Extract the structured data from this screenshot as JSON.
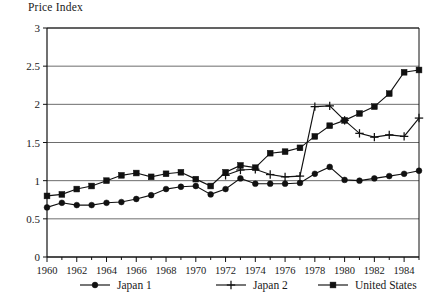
{
  "chart_data": {
    "type": "line",
    "title": "Price Index",
    "ylabel": "Price Index",
    "xlabel": "",
    "ylim": [
      0,
      3
    ],
    "xlim": [
      1960,
      1985
    ],
    "grid": true,
    "legend_position": "bottom",
    "y_ticks": [
      "0",
      "0.5",
      "1",
      "1.5",
      "2",
      "2.5",
      "3"
    ],
    "y_tick_values": [
      0,
      0.5,
      1,
      1.5,
      2,
      2.5,
      3
    ],
    "x_ticks": [
      "1960",
      "1962",
      "1964",
      "1966",
      "1968",
      "1970",
      "1972",
      "1974",
      "1976",
      "1978",
      "1980",
      "1982",
      "1984"
    ],
    "x_tick_values": [
      1960,
      1962,
      1964,
      1966,
      1968,
      1970,
      1972,
      1974,
      1976,
      1978,
      1980,
      1982,
      1984
    ],
    "x": [
      1960,
      1961,
      1962,
      1963,
      1964,
      1965,
      1966,
      1967,
      1968,
      1969,
      1970,
      1971,
      1972,
      1973,
      1974,
      1975,
      1976,
      1977,
      1978,
      1979,
      1980,
      1981,
      1982,
      1983,
      1984,
      1985
    ],
    "series": [
      {
        "name": "Japan 1",
        "marker": "circle",
        "x": [
          1960,
          1961,
          1962,
          1963,
          1964,
          1965,
          1966,
          1967,
          1968,
          1969,
          1970,
          1971,
          1972,
          1973,
          1974,
          1975,
          1976,
          1977,
          1978,
          1979,
          1980,
          1981,
          1982,
          1983,
          1984,
          1985
        ],
        "values": [
          0.65,
          0.71,
          0.68,
          0.68,
          0.71,
          0.72,
          0.76,
          0.81,
          0.89,
          0.92,
          0.93,
          0.82,
          0.89,
          1.03,
          0.96,
          0.96,
          0.96,
          0.97,
          1.09,
          1.18,
          1.01,
          1.0,
          1.03,
          1.06,
          1.09,
          1.13
        ]
      },
      {
        "name": "Japan 2",
        "marker": "plus",
        "x": [
          1972,
          1973,
          1974,
          1975,
          1976,
          1977,
          1978,
          1979,
          1980,
          1981,
          1982,
          1983,
          1984,
          1985
        ],
        "values": [
          1.07,
          1.14,
          1.15,
          1.08,
          1.05,
          1.06,
          1.97,
          1.98,
          1.79,
          1.62,
          1.57,
          1.6,
          1.58,
          1.82
        ]
      },
      {
        "name": "United States",
        "marker": "square",
        "x": [
          1960,
          1961,
          1962,
          1963,
          1964,
          1965,
          1966,
          1967,
          1968,
          1969,
          1970,
          1971,
          1972,
          1973,
          1974,
          1975,
          1976,
          1977,
          1978,
          1979,
          1980,
          1981,
          1982,
          1983,
          1984,
          1985
        ],
        "values": [
          0.8,
          0.82,
          0.89,
          0.93,
          1.0,
          1.07,
          1.1,
          1.05,
          1.09,
          1.11,
          1.02,
          0.93,
          1.11,
          1.2,
          1.17,
          1.36,
          1.38,
          1.43,
          1.58,
          1.72,
          1.79,
          1.88,
          1.97,
          2.14,
          2.42,
          2.45
        ]
      }
    ],
    "legend": [
      {
        "label": "Japan 1",
        "marker": "circle"
      },
      {
        "label": "Japan 2",
        "marker": "plus"
      },
      {
        "label": "United States",
        "marker": "square"
      }
    ],
    "colors": {
      "ink": "#111111",
      "grid": "#6d6d6d",
      "background": "#ffffff"
    }
  }
}
